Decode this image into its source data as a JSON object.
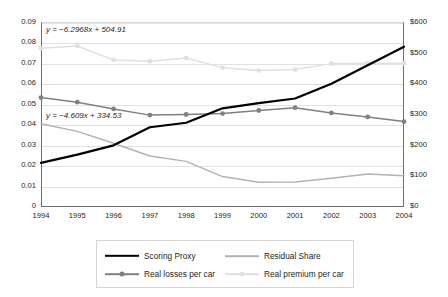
{
  "chart_data": {
    "type": "line",
    "title": "",
    "xlabel": "",
    "ylabel": "",
    "categories": [
      "1994",
      "1995",
      "1996",
      "1997",
      "1998",
      "1999",
      "2000",
      "2001",
      "2002",
      "2003",
      "2004"
    ],
    "axes": {
      "left": {
        "ylim": [
          0,
          0.09
        ],
        "step": 0.01,
        "ticks": [
          "0",
          "0.01",
          "0.02",
          "0.03",
          "0.04",
          "0.05",
          "0.06",
          "0.07",
          "0.08",
          "0.09"
        ]
      },
      "right": {
        "ylim": [
          0,
          600
        ],
        "step": 100,
        "ticks": [
          "$0",
          "$100",
          "$200",
          "$300",
          "$400",
          "$500",
          "$600"
        ]
      },
      "grid": true,
      "legend_position": "bottom"
    },
    "series": [
      {
        "name": "Scoring Proxy",
        "axis": "left",
        "color": "#000000",
        "width": 2.2,
        "markers": false,
        "values": [
          0.0215,
          0.0255,
          0.03,
          0.0388,
          0.041,
          0.048,
          0.0505,
          0.0528,
          0.06,
          0.069,
          0.078
        ]
      },
      {
        "name": "Residual Share",
        "axis": "left",
        "color": "#b3b3b3",
        "width": 1.5,
        "markers": false,
        "values": [
          0.0405,
          0.0368,
          0.031,
          0.0248,
          0.0222,
          0.0148,
          0.012,
          0.0122,
          0.014,
          0.016,
          0.0152
        ]
      },
      {
        "name": "Real losses per car",
        "axis": "right",
        "color": "#808080",
        "width": 1.5,
        "markers": true,
        "values": [
          355,
          340,
          318,
          298,
          300,
          303,
          313,
          322,
          305,
          292,
          277
        ]
      },
      {
        "name": "Real premium per car",
        "axis": "right",
        "color": "#e0e0e0",
        "width": 1.5,
        "markers": true,
        "values": [
          515,
          522,
          477,
          473,
          483,
          452,
          443,
          446,
          465,
          466,
          466
        ]
      }
    ],
    "annotations": [
      {
        "id": "eqn-premium",
        "text_italic": "y",
        "text": " = −6.2968x + 504.91",
        "full": "y = −6.2968x + 504.91"
      },
      {
        "id": "eqn-losses",
        "text_italic": "y",
        "text": " = −4.609x + 334.53",
        "full": "y = −4.609x + 334.53"
      }
    ],
    "legend": [
      {
        "label": "Scoring Proxy",
        "color": "#000000",
        "markers": false,
        "width": 2.4
      },
      {
        "label": "Residual Share",
        "color": "#b3b3b3",
        "markers": false,
        "width": 1.6
      },
      {
        "label": "Real losses per car",
        "color": "#808080",
        "markers": true,
        "width": 1.6
      },
      {
        "label": "Real premium per car",
        "color": "#e0e0e0",
        "markers": true,
        "width": 1.6
      }
    ]
  }
}
